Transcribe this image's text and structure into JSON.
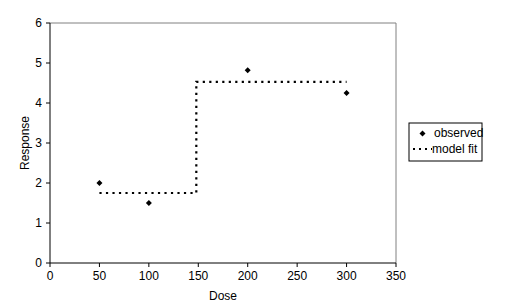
{
  "chart_data": {
    "type": "scatter",
    "title": "",
    "xlabel": "Dose",
    "ylabel": "Response",
    "xlim": [
      0,
      350
    ],
    "ylim": [
      0,
      6
    ],
    "xticks": [
      0,
      50,
      100,
      150,
      200,
      250,
      300,
      350
    ],
    "yticks": [
      0,
      1,
      2,
      3,
      4,
      5,
      6
    ],
    "grid": false,
    "legend_position": "right",
    "series": [
      {
        "name": "observed",
        "type": "scatter",
        "marker": "diamond",
        "x": [
          50,
          100,
          200,
          300
        ],
        "y": [
          2.0,
          1.5,
          4.82,
          4.25
        ]
      },
      {
        "name": "model fit",
        "type": "line",
        "style": "dotted",
        "x": [
          50,
          148,
          148,
          300
        ],
        "y": [
          1.75,
          1.75,
          4.53,
          4.53
        ]
      }
    ]
  },
  "legend": {
    "observed_label": "observed",
    "model_label": "model fit"
  },
  "axes": {
    "x_title": "Dose",
    "y_title": "Response"
  },
  "colors": {
    "axis": "#808080",
    "marker": "#000000",
    "line": "#000000",
    "background": "#ffffff"
  }
}
